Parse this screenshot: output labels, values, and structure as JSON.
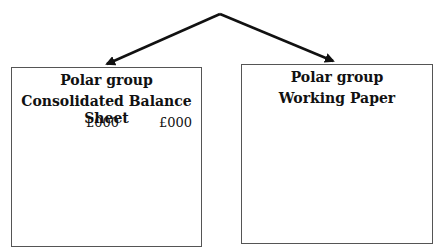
{
  "diagram": {
    "type": "split-arrow",
    "arrow_color": "#111111",
    "apex": {
      "x": 220,
      "y": 14
    },
    "targets": [
      "left-box",
      "right-box"
    ]
  },
  "left_box": {
    "title_line1": "Polar group",
    "title_line2": "Consolidated Balance Sheet",
    "column_headers": [
      "£000",
      "£000"
    ]
  },
  "right_box": {
    "title_line1": "Polar group",
    "title_line2": "Working Paper"
  }
}
